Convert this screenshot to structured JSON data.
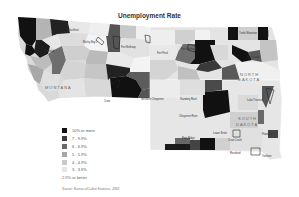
{
  "title": "Unemployment Rate",
  "states": [
    {
      "name": "MONTANA",
      "x": 45,
      "y": 88
    },
    {
      "name": "NORTH DAKOTA",
      "line1": "NORTH",
      "line2": "DAKOTA",
      "x": 245,
      "y": 77
    },
    {
      "name": "SOUTH DAKOTA",
      "line1": "SOUTH",
      "line2": "DAKOTA",
      "x": 240,
      "y": 120
    }
  ],
  "reservation_labels": [
    {
      "name": "Blackfeet",
      "x": 70,
      "y": 30
    },
    {
      "name": "Rocky Boy's",
      "x": 85,
      "y": 43
    },
    {
      "name": "Fort Belknap",
      "x": 125,
      "y": 47
    },
    {
      "name": "Fort Peck",
      "x": 160,
      "y": 52
    },
    {
      "name": "Fort Berthold",
      "x": 180,
      "y": 47
    },
    {
      "name": "Turtle Mountain",
      "x": 240,
      "y": 33
    },
    {
      "name": "Spirit Lake",
      "x": 245,
      "y": 57
    },
    {
      "name": "Flathead",
      "x": 45,
      "y": 50
    },
    {
      "name": "Crow",
      "x": 115,
      "y": 101
    },
    {
      "name": "Northern Cheyenne",
      "x": 145,
      "y": 100
    },
    {
      "name": "Standing Rock",
      "x": 183,
      "y": 101
    },
    {
      "name": "Lake Traverse",
      "x": 255,
      "y": 100
    },
    {
      "name": "Cheyenne River",
      "x": 185,
      "y": 117
    },
    {
      "name": "Lower Brule",
      "x": 210,
      "y": 133
    },
    {
      "name": "Crow Creek",
      "x": 228,
      "y": 139
    },
    {
      "name": "Pine Ridge",
      "x": 185,
      "y": 139
    },
    {
      "name": "Rosebud",
      "x": 230,
      "y": 152
    },
    {
      "name": "Yankton",
      "x": 265,
      "y": 155
    },
    {
      "name": "Flandreau",
      "x": 268,
      "y": 133
    }
  ],
  "legend": {
    "items": [
      {
        "label": "10% or more",
        "color": "#111111"
      },
      {
        "label": "7 - 9.9%",
        "color": "#3c3c3c"
      },
      {
        "label": "6 - 6.9%",
        "color": "#6a6a6a"
      },
      {
        "label": "5 - 5.9%",
        "color": "#a6a6a6"
      },
      {
        "label": "4 - 4.9%",
        "color": "#c9c9c9"
      },
      {
        "label": "3 - 3.9%",
        "color": "#e6e6e6"
      }
    ],
    "last_label": "2.9% or better"
  },
  "source": "Source: Bureau of Labor Statistics, 2002"
}
